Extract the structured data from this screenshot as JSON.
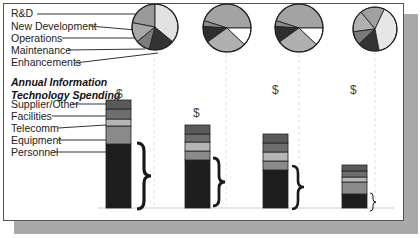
{
  "chart_data": {
    "type": "bar",
    "title": "Annual Information Technology Spending",
    "subtitle": "$",
    "stacked": true,
    "grid": false,
    "categories": [
      "Period 1",
      "Period 2",
      "Period 3",
      "Period 4"
    ],
    "bar_legend": [
      "Supplier/Other",
      "Facilities",
      "Telecomm",
      "Equipment",
      "Personnel"
    ],
    "series": [
      {
        "name": "Personnel",
        "values": [
          64,
          48,
          38,
          14
        ],
        "color": "#1e1e1e"
      },
      {
        "name": "Equipment",
        "values": [
          18,
          9,
          9,
          12
        ],
        "color": "#8a8a8a"
      },
      {
        "name": "Telecomm",
        "values": [
          7,
          9,
          9,
          5
        ],
        "color": "#b5b5b5"
      },
      {
        "name": "Facilities",
        "values": [
          10,
          8,
          9,
          6
        ],
        "color": "#6e6e6e"
      },
      {
        "name": "Supplier/Other",
        "values": [
          9,
          9,
          9,
          6
        ],
        "color": "#5a5a5a"
      }
    ],
    "totals_label": [
      "$",
      "$",
      "$",
      "$"
    ],
    "pie_legend": [
      "R&D",
      "New Development",
      "Operations",
      "Maintenance",
      "Enhancements"
    ],
    "pies": [
      {
        "slices": [
          {
            "name": "R&D",
            "value": 22,
            "color": "#9a9a9a"
          },
          {
            "name": "New Development",
            "value": 14,
            "color": "#a8a8a8"
          },
          {
            "name": "Enhancements",
            "value": 10,
            "color": "#7d7d7d"
          },
          {
            "name": "Maintenance",
            "value": 18,
            "color": "#333333"
          },
          {
            "name": "Operations",
            "value": 36,
            "color": "#e2e2e2"
          }
        ]
      },
      {
        "slices": [
          {
            "name": "R&D",
            "value": 45,
            "color": "#a3a3a3"
          },
          {
            "name": "New Development",
            "value": 4,
            "color": "#8a8a8a"
          },
          {
            "name": "Enhancements",
            "value": 11,
            "color": "#2e2e2e"
          },
          {
            "name": "Maintenance",
            "value": 28,
            "color": "#b0b0b0"
          },
          {
            "name": "Operations",
            "value": 12,
            "color": "#ffffff"
          }
        ]
      },
      {
        "slices": [
          {
            "name": "R&D",
            "value": 45,
            "color": "#a3a3a3"
          },
          {
            "name": "New Development",
            "value": 4,
            "color": "#8a8a8a"
          },
          {
            "name": "Enhancements",
            "value": 11,
            "color": "#2e2e2e"
          },
          {
            "name": "Maintenance",
            "value": 28,
            "color": "#b0b0b0"
          },
          {
            "name": "Operations",
            "value": 12,
            "color": "#ffffff"
          }
        ]
      },
      {
        "slices": [
          {
            "name": "R&D",
            "value": 18,
            "color": "#a0a0a0"
          },
          {
            "name": "New Development",
            "value": 16,
            "color": "#b0b0b0"
          },
          {
            "name": "Enhancements",
            "value": 10,
            "color": "#7a7a7a"
          },
          {
            "name": "Maintenance",
            "value": 16,
            "color": "#333333"
          },
          {
            "name": "Operations",
            "value": 40,
            "color": "#e6e6e6"
          }
        ]
      }
    ]
  },
  "legend": {
    "pie": [
      "R&D",
      "New Development",
      "Operations",
      "Maintenance",
      "Enhancements"
    ],
    "bar": [
      "Supplier/Other",
      "Facilities",
      "Telecomm",
      "Equipment",
      "Personnel"
    ]
  },
  "title": {
    "line1": "Annual Information",
    "line2": "Technology Spending",
    "dollar": "$"
  },
  "dollar_marks": [
    "$",
    "$",
    "$"
  ]
}
